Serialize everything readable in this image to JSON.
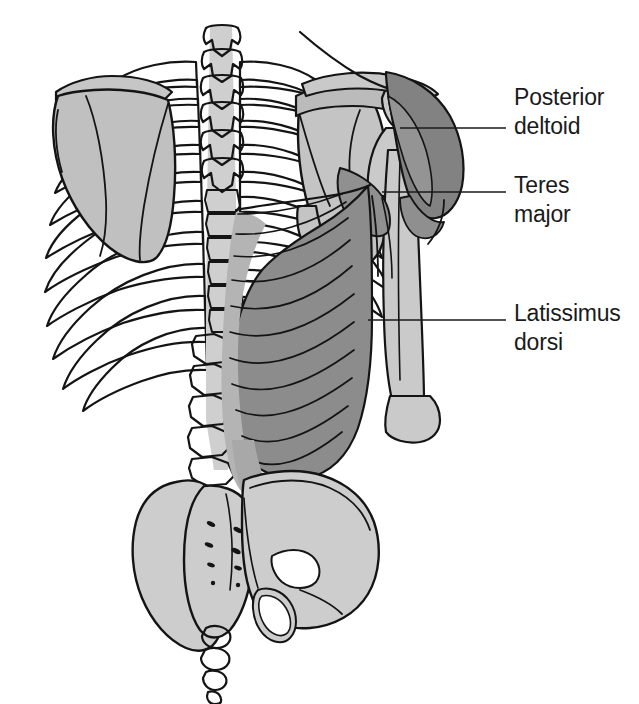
{
  "figure": {
    "background_color": "#ffffff",
    "width": 639,
    "height": 704
  },
  "palette": {
    "bone_light": "#cfcfcf",
    "bone_mid": "#c0c0c0",
    "bone_shadow": "#b3b3b3",
    "muscle_light": "#b6b6b6",
    "muscle_mid": "#9d9d9d",
    "muscle_dark": "#8a8a8a",
    "muscle_darkest": "#7e7e7e",
    "outline": "#141414",
    "text": "#1a1a1a",
    "white": "#ffffff"
  },
  "labels": [
    {
      "id": "posterior-deltoid",
      "line1": "Posterior",
      "line2": "deltoid",
      "text_x": 514,
      "line1_y": 105,
      "line2_y": 134,
      "leader_from_x": 400,
      "leader_from_y": 128,
      "leader_to_x": 506,
      "leader_to_y": 128
    },
    {
      "id": "teres-major",
      "line1": "Teres",
      "line2": "major",
      "text_x": 514,
      "line1_y": 193,
      "line2_y": 222,
      "leader_from_x": 382,
      "leader_from_y": 192,
      "leader_to_x": 506,
      "leader_to_y": 192
    },
    {
      "id": "latissimus-dorsi",
      "line1": "Latissimus",
      "line2": "dorsi",
      "text_x": 514,
      "line1_y": 321,
      "line2_y": 350,
      "leader_from_x": 368,
      "leader_from_y": 320,
      "leader_to_x": 506,
      "leader_to_y": 320
    }
  ],
  "structures": [
    {
      "id": "cervical-thoracic-vertebrae",
      "name": "vertebral column spinous processes",
      "tone": "bone_light"
    },
    {
      "id": "rib-cage-left",
      "name": "left ribs (posterior)",
      "tone": "bone_light"
    },
    {
      "id": "rib-cage-right",
      "name": "right ribs (posterior)",
      "tone": "bone_light"
    },
    {
      "id": "scapula-left",
      "name": "left scapula",
      "tone": "bone_mid"
    },
    {
      "id": "scapula-right",
      "name": "right scapula",
      "tone": "bone_mid"
    },
    {
      "id": "clavicle-right",
      "name": "right clavicle",
      "tone": "bone_light"
    },
    {
      "id": "humerus-right",
      "name": "right humerus",
      "tone": "bone_light"
    },
    {
      "id": "lumbar-vertebrae",
      "name": "lumbar vertebrae",
      "tone": "bone_light"
    },
    {
      "id": "sacrum",
      "name": "sacrum with posterior sacral foramina",
      "tone": "bone_light"
    },
    {
      "id": "coccyx",
      "name": "coccyx",
      "tone": "bone_light"
    },
    {
      "id": "ilium-left",
      "name": "left ilium",
      "tone": "bone_light"
    },
    {
      "id": "ilium-right",
      "name": "right ilium",
      "tone": "bone_light"
    },
    {
      "id": "deltoid-muscle",
      "name": "posterior deltoid muscle",
      "tone": "muscle_darkest"
    },
    {
      "id": "teres-major-muscle",
      "name": "teres major muscle",
      "tone": "muscle_dark"
    },
    {
      "id": "latissimus-dorsi-muscle",
      "name": "latissimus dorsi muscle",
      "tone": "muscle_dark"
    },
    {
      "id": "thoracolumbar-fascia",
      "name": "thoracolumbar fascia / aponeurosis",
      "tone": "muscle_light"
    }
  ],
  "counts": {
    "ribs_left": 11,
    "ribs_right": 10,
    "latissimus_fiber_lines": 11,
    "sacral_foramina_pairs": 4,
    "coccyx_segments": 4
  }
}
